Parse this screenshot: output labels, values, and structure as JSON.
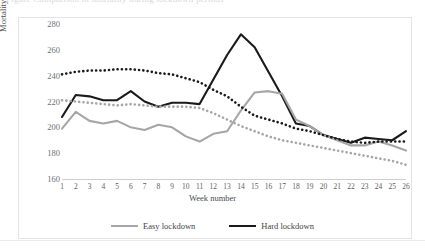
{
  "caption": {
    "clipped_text": "Figure  Comparison of mortality during lockdown periods"
  },
  "axes": {
    "y_title": "Mortality per million",
    "x_title": "Week number",
    "y_ticks": [
      280,
      260,
      240,
      220,
      200,
      180,
      160
    ],
    "y_min": 160,
    "y_max": 280,
    "x_ticks": [
      1,
      2,
      3,
      4,
      5,
      6,
      7,
      8,
      9,
      10,
      11,
      12,
      13,
      14,
      15,
      16,
      17,
      18,
      19,
      20,
      21,
      22,
      23,
      24,
      25,
      26
    ]
  },
  "legend": {
    "position": "bottom-center",
    "items": [
      {
        "label": "Easy lockdown",
        "color": "#a6a6a6",
        "style": "solid"
      },
      {
        "label": "Hard lockdown",
        "color": "#1a1a1a",
        "style": "solid"
      }
    ]
  },
  "colors": {
    "hard": "#1a1a1a",
    "easy": "#a6a6a6",
    "frame": "#e3e3e6",
    "axis": "#cfcfd3",
    "tick_text": "#6f6f74"
  },
  "chart_data": {
    "type": "line",
    "title": "",
    "subtitle": "",
    "xlabel": "Week number",
    "ylabel": "Mortality per million",
    "xlim": [
      1,
      26
    ],
    "ylim": [
      160,
      280
    ],
    "grid": false,
    "legend_position": "bottom-center",
    "x": [
      1,
      2,
      3,
      4,
      5,
      6,
      7,
      8,
      9,
      10,
      11,
      12,
      13,
      14,
      15,
      16,
      17,
      18,
      19,
      20,
      21,
      22,
      23,
      24,
      25,
      26
    ],
    "series": [
      {
        "name": "Hard lockdown",
        "color": "#1a1a1a",
        "style": "solid",
        "values": [
          208,
          225,
          224,
          221,
          221,
          228,
          220,
          216,
          219,
          219,
          218,
          237,
          256,
          272,
          262,
          243,
          224,
          203,
          201,
          194,
          191,
          188,
          192,
          191,
          190,
          197
        ]
      },
      {
        "name": "Easy lockdown",
        "color": "#a6a6a6",
        "style": "solid",
        "values": [
          199,
          212,
          205,
          203,
          205,
          200,
          198,
          202,
          200,
          193,
          189,
          195,
          197,
          213,
          227,
          228,
          226,
          206,
          201,
          194,
          190,
          186,
          186,
          189,
          186,
          182
        ]
      },
      {
        "name": "Hard lockdown (baseline, dotted)",
        "color": "#1a1a1a",
        "style": "dotted",
        "values": [
          241,
          243,
          244,
          244,
          245,
          245,
          244,
          242,
          241,
          238,
          235,
          229,
          224,
          216,
          209,
          206,
          203,
          199,
          197,
          194,
          191,
          189,
          188,
          189,
          189,
          189
        ]
      },
      {
        "name": "Easy lockdown (baseline, dotted)",
        "color": "#a6a6a6",
        "style": "dotted",
        "values": [
          221,
          220,
          219,
          218,
          217,
          218,
          217,
          216,
          216,
          216,
          215,
          211,
          206,
          201,
          197,
          193,
          190,
          188,
          186,
          184,
          182,
          180,
          178,
          176,
          174,
          171
        ]
      }
    ]
  }
}
